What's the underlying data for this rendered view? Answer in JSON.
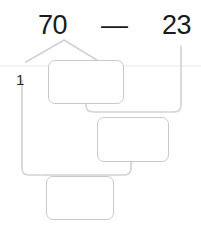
{
  "problem": {
    "type": "subtraction",
    "minuend": "70",
    "operator": "—",
    "subtrahend": "23",
    "regroup_mark": "1",
    "answer_boxes": [
      "",
      "",
      ""
    ]
  },
  "labels": {
    "minuend": "70",
    "operator": "—",
    "subtrahend": "23",
    "carry": "1"
  },
  "colors": {
    "text": "#1a1a1a",
    "wire": "#d2d2d2",
    "box_border": "#c9c9c9",
    "background": "#ffffff"
  }
}
